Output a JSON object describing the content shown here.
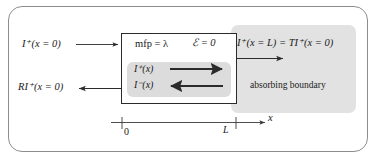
{
  "figure": {
    "colors": {
      "frame": "#8d8d8d",
      "slab_border": "#2b2b2b",
      "absorbing_fill": "#e2e2e2",
      "flux_fill": "#dcdcdc",
      "text": "#1a1a1a"
    }
  },
  "labels": {
    "incident": "I⁺(x = 0)",
    "reflected": "RI⁺(x = 0)",
    "mfp": "mfp = λ",
    "efield": "ℰ = 0",
    "flux_forward": "I⁺(x)",
    "flux_backward": "I⁻(x)",
    "transmitted": "I⁺(x = L) = TI⁺(x = 0)",
    "absorbing": "absorbing boundary"
  },
  "axis": {
    "name": "x",
    "ticks": [
      {
        "label": "0",
        "value": 0
      },
      {
        "label": "L",
        "value": 1
      }
    ]
  },
  "arrows": [
    {
      "name": "incident-arrow",
      "direction": "right"
    },
    {
      "name": "reflected-arrow",
      "direction": "left"
    },
    {
      "name": "flux-forward-arrow",
      "direction": "right"
    },
    {
      "name": "flux-backward-arrow",
      "direction": "left"
    },
    {
      "name": "transmitted-arrow",
      "direction": "right"
    },
    {
      "name": "axis-arrow",
      "direction": "right"
    }
  ]
}
